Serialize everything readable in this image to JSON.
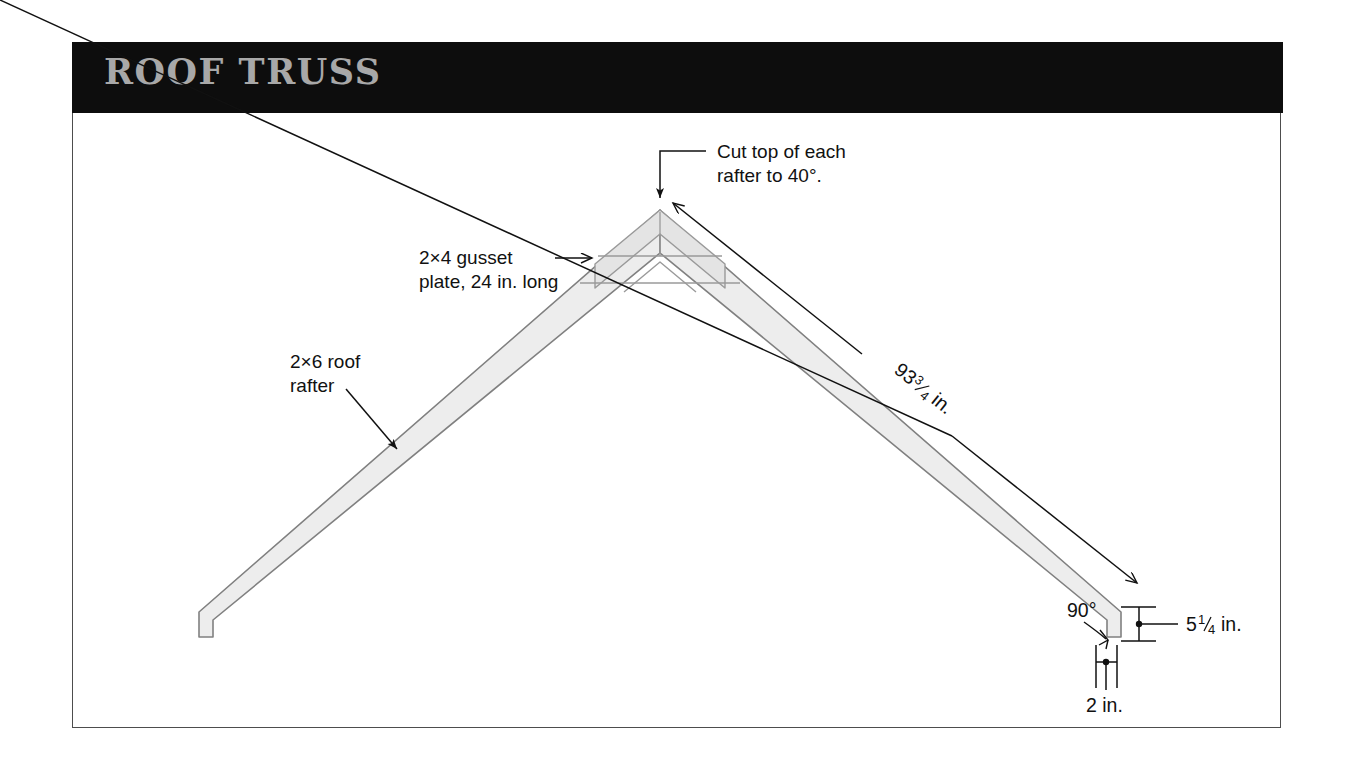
{
  "banner": {
    "title": "ROOF TRUSS"
  },
  "colors": {
    "banner_bg": "#0d0d0d",
    "banner_text": "#a8a8a8",
    "frame_border": "#4d4d4d",
    "lumber_fill": "#ededed",
    "lumber_stroke": "#808080",
    "gusset_fill": "#e4e4e4",
    "annotation": "#111111",
    "page_bg": "#ffffff"
  },
  "annotations": {
    "peak_note": {
      "line1": "Cut top of each",
      "line2": "rafter to 40°.",
      "angle_value": "40",
      "units": "degrees"
    },
    "gusset_note": {
      "line1": "2×4 gusset",
      "line2": "plate, 24 in. long",
      "lumber_size": "2×4",
      "length_value": "24",
      "length_units": "in."
    },
    "rafter_note": {
      "line1": "2×6 roof",
      "line2": "rafter",
      "lumber_size": "2×6"
    },
    "rafter_length": {
      "whole": "93",
      "fraction_numerator": "3",
      "fraction_denominator": "4",
      "units": "in.",
      "full_text": "93 3/4 in."
    },
    "depth_dimension": {
      "whole": "5",
      "fraction_numerator": "1",
      "fraction_denominator": "4",
      "units": "in.",
      "full_text": "5 1/4 in."
    },
    "width_dimension": {
      "value": "2",
      "units": "in.",
      "full_text": "2 in."
    },
    "corner_angle": {
      "value": "90",
      "symbol": "°",
      "full_text": "90°"
    }
  }
}
